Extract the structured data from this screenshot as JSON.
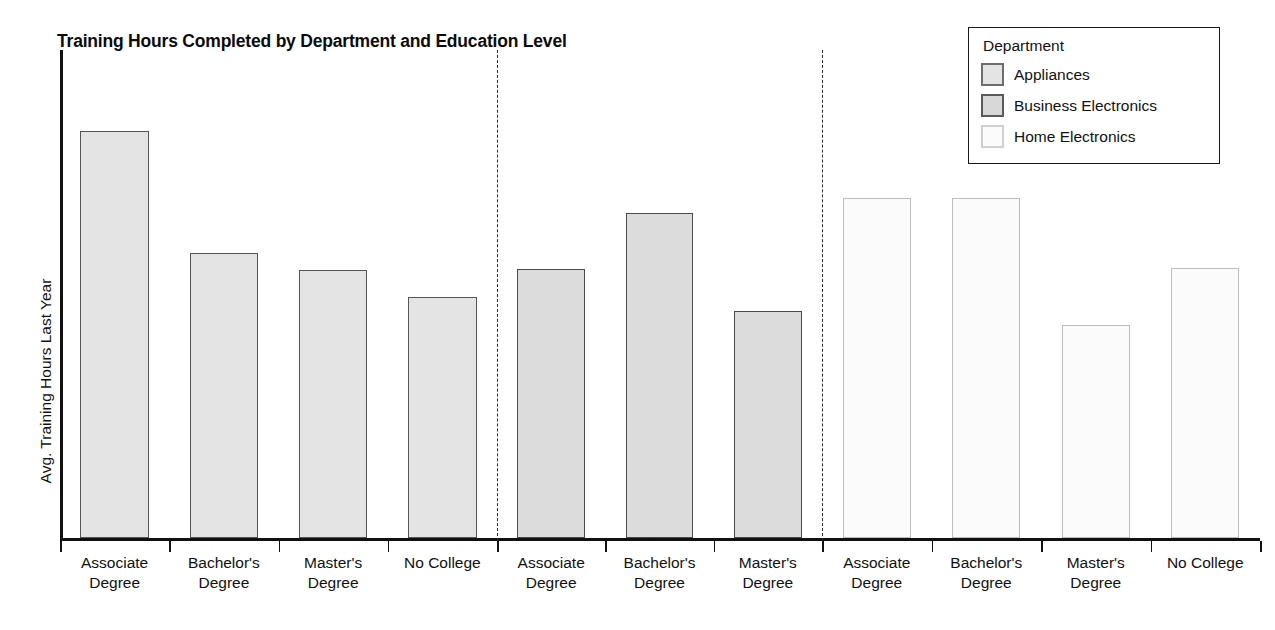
{
  "chart_data": {
    "type": "bar",
    "title": "Training Hours Completed by Department and Education Level",
    "xlabel": "",
    "ylabel": "Avg. Training Hours Last Year",
    "grid": false,
    "ylim": [
      0,
      100
    ],
    "y_axis_ticks_visible": false,
    "legend": {
      "title": "Department",
      "position": "top-right",
      "entries": [
        "Appliances",
        "Business Electronics",
        "Home Electronics"
      ]
    },
    "group_by": "Department",
    "category_axis": "Education Level",
    "groups": [
      {
        "name": "Appliances",
        "swatch": "#e4e4e4",
        "categories": [
          "Associate Degree",
          "Bachelor's Degree",
          "Master's Degree",
          "No College"
        ],
        "category_lines": [
          [
            "Associate",
            "Degree"
          ],
          [
            "Bachelor's",
            "Degree"
          ],
          [
            "Master's",
            "Degree"
          ],
          [
            "No College",
            ""
          ]
        ],
        "values": [
          83.4,
          58.4,
          54.9,
          49.4
        ]
      },
      {
        "name": "Business Electronics",
        "swatch": "#dcdcdc",
        "categories": [
          "Associate Degree",
          "Bachelor's Degree",
          "Master's Degree"
        ],
        "category_lines": [
          [
            "Associate",
            "Degree"
          ],
          [
            "Bachelor's",
            "Degree"
          ],
          [
            "Master's",
            "Degree"
          ]
        ],
        "values": [
          55.1,
          66.6,
          46.5
        ]
      },
      {
        "name": "Home Electronics",
        "swatch": "#fbfbfb",
        "categories": [
          "Associate Degree",
          "Bachelor's Degree",
          "Master's Degree",
          "No College"
        ],
        "category_lines": [
          [
            "Associate",
            "Degree"
          ],
          [
            "Bachelor's",
            "Degree"
          ],
          [
            "Master's",
            "Degree"
          ],
          [
            "No College",
            ""
          ]
        ],
        "values": [
          69.7,
          69.7,
          43.6,
          55.3
        ]
      }
    ],
    "separators": 2,
    "colors": {
      "appliances": "#e4e4e4",
      "business_electronics": "#dcdcdc",
      "home_electronics": "#fbfbfb",
      "axis": "#111111",
      "bar_outline": "#555555",
      "separator": "#2a2a2a"
    }
  }
}
